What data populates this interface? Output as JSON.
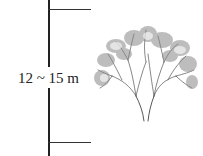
{
  "diagram": {
    "height_label": "12 ~ 15 m",
    "line_color": "#222222"
  }
}
